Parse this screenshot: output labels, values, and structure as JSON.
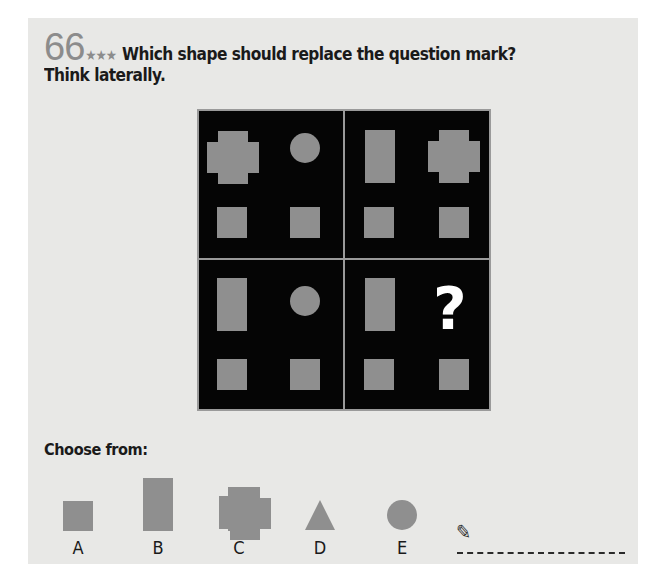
{
  "puzzle": {
    "number": "66",
    "difficulty_stars": "★★★",
    "difficulty_level": 3,
    "question": "Which shape should replace the question mark?",
    "subtitle": "Think laterally."
  },
  "grid": {
    "colors": {
      "background": "#050505",
      "divider": "#9a9a9a",
      "shape": "#8f8f8f",
      "question_mark": "#ffffff"
    },
    "quadrants": [
      {
        "position": "top-left",
        "shapes": [
          "cross",
          "circle",
          "square",
          "square"
        ]
      },
      {
        "position": "top-right",
        "shapes": [
          "rectangle",
          "cross",
          "square",
          "square"
        ]
      },
      {
        "position": "bottom-left",
        "shapes": [
          "rectangle",
          "circle",
          "square",
          "square"
        ]
      },
      {
        "position": "bottom-right",
        "shapes": [
          "rectangle",
          "?",
          "square",
          "square"
        ]
      }
    ],
    "unknown_symbol": "?"
  },
  "choices": {
    "label": "Choose from:",
    "options": [
      {
        "letter": "A",
        "shape": "square"
      },
      {
        "letter": "B",
        "shape": "rectangle"
      },
      {
        "letter": "C",
        "shape": "cross"
      },
      {
        "letter": "D",
        "shape": "triangle"
      },
      {
        "letter": "E",
        "shape": "circle"
      }
    ]
  },
  "answer": {
    "icon": "pencil-icon",
    "icon_glyph": "✎",
    "value": ""
  }
}
